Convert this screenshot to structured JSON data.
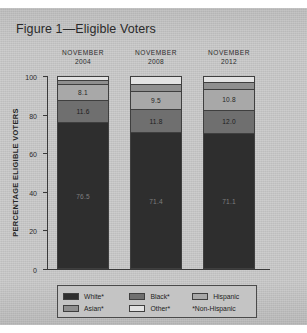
{
  "figure": {
    "title": "Figure 1—Eligible Voters"
  },
  "columns": [
    {
      "month": "NOVEMBER",
      "year": "2004"
    },
    {
      "month": "NOVEMBER",
      "year": "2008"
    },
    {
      "month": "NOVEMBER",
      "year": "2012"
    }
  ],
  "axis": {
    "y_label": "PERCENTAGE ELIGIBLE VOTERS",
    "y_ticks": [
      "100",
      "80",
      "60",
      "40",
      "20",
      "0"
    ]
  },
  "legend": {
    "row1": [
      {
        "label": "White*",
        "color": "#2e2e2e"
      },
      {
        "label": "Black*",
        "color": "#6f6f6f"
      },
      {
        "label": "Hispanic",
        "color": "#a8a8a8"
      }
    ],
    "row2": [
      {
        "label": "Asian*",
        "color": "#8f8f8f"
      },
      {
        "label": "Other*",
        "color": "#e2e2e2"
      }
    ],
    "footnote": "*Non-Hispanic"
  },
  "chart_data": {
    "type": "bar",
    "title": "Figure 1—Eligible Voters",
    "xlabel": "",
    "ylabel": "PERCENTAGE ELIGIBLE VOTERS",
    "ylim": [
      0,
      100
    ],
    "yticks": [
      0,
      20,
      40,
      60,
      80,
      100
    ],
    "grid": false,
    "stacked": true,
    "legend_position": "bottom",
    "categories": [
      "NOVEMBER 2004",
      "NOVEMBER 2008",
      "NOVEMBER 2012"
    ],
    "series": [
      {
        "name": "White*",
        "color": "#2e2e2e",
        "values": [
          76.5,
          71.4,
          71.1
        ],
        "labels": [
          "76.5",
          "71.4",
          "71.1"
        ]
      },
      {
        "name": "Black*",
        "color": "#6f6f6f",
        "values": [
          11.6,
          11.8,
          12.0
        ],
        "labels": [
          "11.6",
          "11.8",
          "12.0"
        ]
      },
      {
        "name": "Hispanic",
        "color": "#a8a8a8",
        "values": [
          8.1,
          9.5,
          10.8
        ],
        "labels": [
          "8.1",
          "9.5",
          "10.8"
        ]
      },
      {
        "name": "Asian*",
        "color": "#8f8f8f",
        "values": [
          2.5,
          3.5,
          3.6
        ],
        "labels": [
          "",
          "",
          ""
        ]
      },
      {
        "name": "Other*",
        "color": "#e2e2e2",
        "values": [
          1.3,
          3.8,
          2.5
        ],
        "labels": [
          "",
          "",
          ""
        ]
      }
    ],
    "annotations": [
      "*Non-Hispanic"
    ]
  }
}
